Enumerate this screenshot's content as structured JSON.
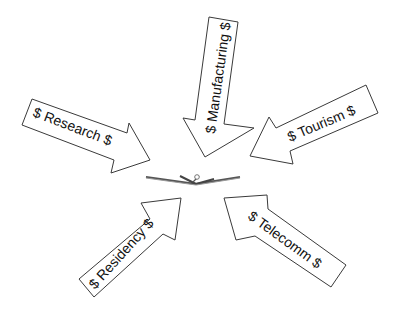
{
  "diagram": {
    "center": {
      "icon": "open-book-icon"
    },
    "arrows": [
      {
        "id": "manufacturing",
        "label": "$ Manufacturing $",
        "direction": "down"
      },
      {
        "id": "research",
        "label": "$ Research $",
        "direction": "down-right"
      },
      {
        "id": "tourism",
        "label": "$ Tourism $",
        "direction": "down-left"
      },
      {
        "id": "residency",
        "label": "$ Residency $",
        "direction": "up-right"
      },
      {
        "id": "telecomm",
        "label": "$ Telecomm $",
        "direction": "up-left"
      }
    ],
    "colors": {
      "stroke": "#3a3a3a",
      "fill": "#ffffff",
      "text": "#111111"
    }
  }
}
